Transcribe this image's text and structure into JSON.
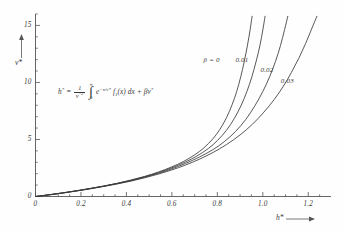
{
  "chart_data": {
    "type": "line",
    "title": "",
    "xlabel": "h*",
    "ylabel": "v*",
    "xlim": [
      0,
      1.3
    ],
    "ylim": [
      0,
      16
    ],
    "grid": false,
    "legend_position": "inline-curve-labels",
    "x_ticks": [
      "0",
      "0.2",
      "0.4",
      "0.6",
      "0.8",
      "1.0",
      "1.2"
    ],
    "x_tick_values": [
      0,
      0.2,
      0.4,
      0.6,
      0.8,
      1.0,
      1.2
    ],
    "y_ticks": [
      "0",
      "5",
      "10",
      "15"
    ],
    "y_tick_values": [
      0,
      5,
      10,
      15
    ],
    "x_minor_step": 0.05,
    "y_minor_step": 1,
    "annotation": "h* = (1/v*^2) ∫₀^∞ e^(-x/v*) f₁(x) dx + β v*",
    "series": [
      {
        "name": "β = 0",
        "beta": 0,
        "label": "β = 0",
        "label_x": 0.845,
        "label_y": 12.0,
        "points": [
          [
            0.0,
            0.0
          ],
          [
            0.06,
            0.15
          ],
          [
            0.12,
            0.32
          ],
          [
            0.18,
            0.5
          ],
          [
            0.24,
            0.7
          ],
          [
            0.3,
            0.92
          ],
          [
            0.36,
            1.16
          ],
          [
            0.42,
            1.44
          ],
          [
            0.48,
            1.76
          ],
          [
            0.54,
            2.14
          ],
          [
            0.6,
            2.6
          ],
          [
            0.65,
            3.06
          ],
          [
            0.7,
            3.65
          ],
          [
            0.74,
            4.25
          ],
          [
            0.78,
            5.05
          ],
          [
            0.81,
            5.85
          ],
          [
            0.84,
            6.9
          ],
          [
            0.865,
            8.05
          ],
          [
            0.885,
            9.2
          ],
          [
            0.903,
            10.5
          ],
          [
            0.918,
            11.8
          ],
          [
            0.932,
            13.2
          ],
          [
            0.944,
            14.6
          ],
          [
            0.953,
            15.8
          ]
        ]
      },
      {
        "name": "0.01",
        "beta": 0.01,
        "label": "0.01",
        "label_x": 0.985,
        "label_y": 12.0,
        "points": [
          [
            0.0,
            0.0
          ],
          [
            0.06,
            0.15
          ],
          [
            0.12,
            0.32
          ],
          [
            0.18,
            0.5
          ],
          [
            0.24,
            0.7
          ],
          [
            0.3,
            0.91
          ],
          [
            0.36,
            1.15
          ],
          [
            0.42,
            1.42
          ],
          [
            0.48,
            1.73
          ],
          [
            0.54,
            2.09
          ],
          [
            0.6,
            2.52
          ],
          [
            0.66,
            3.03
          ],
          [
            0.71,
            3.55
          ],
          [
            0.76,
            4.2
          ],
          [
            0.8,
            4.9
          ],
          [
            0.84,
            5.8
          ],
          [
            0.875,
            6.85
          ],
          [
            0.905,
            8.0
          ],
          [
            0.93,
            9.2
          ],
          [
            0.952,
            10.5
          ],
          [
            0.97,
            11.8
          ],
          [
            0.987,
            13.2
          ],
          [
            1.0,
            14.6
          ],
          [
            1.01,
            15.8
          ]
        ]
      },
      {
        "name": "0.02",
        "beta": 0.02,
        "label": "0.02",
        "label_x": 1.095,
        "label_y": 11.1,
        "points": [
          [
            0.0,
            0.0
          ],
          [
            0.06,
            0.15
          ],
          [
            0.12,
            0.31
          ],
          [
            0.18,
            0.49
          ],
          [
            0.24,
            0.69
          ],
          [
            0.3,
            0.9
          ],
          [
            0.36,
            1.13
          ],
          [
            0.42,
            1.39
          ],
          [
            0.48,
            1.69
          ],
          [
            0.54,
            2.03
          ],
          [
            0.6,
            2.43
          ],
          [
            0.66,
            2.9
          ],
          [
            0.72,
            3.45
          ],
          [
            0.78,
            4.1
          ],
          [
            0.83,
            4.8
          ],
          [
            0.88,
            5.7
          ],
          [
            0.925,
            6.75
          ],
          [
            0.965,
            7.95
          ],
          [
            1.0,
            9.2
          ],
          [
            1.03,
            10.5
          ],
          [
            1.056,
            11.85
          ],
          [
            1.078,
            13.25
          ],
          [
            1.096,
            14.65
          ],
          [
            1.11,
            15.8
          ]
        ]
      },
      {
        "name": "0.03",
        "beta": 0.03,
        "label": "0.03",
        "label_x": 1.185,
        "label_y": 10.1,
        "points": [
          [
            0.0,
            0.0
          ],
          [
            0.06,
            0.14
          ],
          [
            0.12,
            0.3
          ],
          [
            0.18,
            0.48
          ],
          [
            0.24,
            0.67
          ],
          [
            0.3,
            0.88
          ],
          [
            0.36,
            1.1
          ],
          [
            0.42,
            1.35
          ],
          [
            0.48,
            1.64
          ],
          [
            0.54,
            1.96
          ],
          [
            0.6,
            2.33
          ],
          [
            0.66,
            2.76
          ],
          [
            0.72,
            3.26
          ],
          [
            0.78,
            3.85
          ],
          [
            0.84,
            4.55
          ],
          [
            0.9,
            5.4
          ],
          [
            0.955,
            6.35
          ],
          [
            1.005,
            7.4
          ],
          [
            1.05,
            8.5
          ],
          [
            1.09,
            9.65
          ],
          [
            1.125,
            10.85
          ],
          [
            1.158,
            12.1
          ],
          [
            1.188,
            13.4
          ],
          [
            1.215,
            14.7
          ],
          [
            1.238,
            15.8
          ]
        ]
      }
    ]
  },
  "axes": {
    "x_axis_label": "h*",
    "y_axis_label": "v*",
    "x_axis_superscript": "*",
    "y_axis_superscript": "*"
  },
  "equation": {
    "lhs": "h",
    "lhs_star": "*",
    "equals": "=",
    "frac_num": "1",
    "frac_den_base": "v",
    "frac_den_star": "*",
    "frac_den_exp": "2",
    "integral_symbol": "∫",
    "integral_upper": "∞",
    "integral_lower": "0",
    "exponential_base": "e",
    "exponential_exp": "−x/v*",
    "function_name": "f",
    "function_index": "1",
    "function_arg": "(x)",
    "differential": "dx",
    "plus": "+",
    "beta_symbol": "β",
    "beta_var": "v",
    "beta_var_star": "*"
  }
}
